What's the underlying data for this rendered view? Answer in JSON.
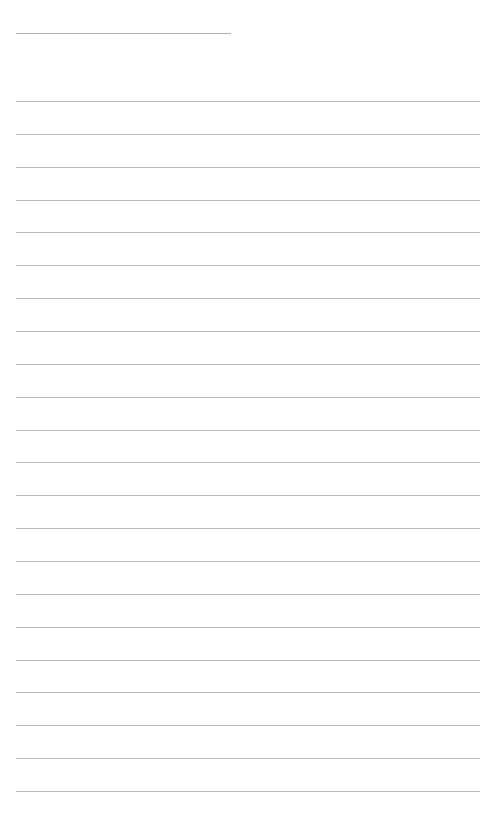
{
  "document": {
    "type": "lined-paper",
    "header_rule": {
      "x": 16,
      "y": 33,
      "width": 215
    },
    "rules": {
      "count": 22,
      "start_y": 101,
      "spacing": 32.86,
      "left": 16,
      "right": 480
    },
    "colors": {
      "background": "#ffffff",
      "line": "#b9b9b9"
    }
  }
}
